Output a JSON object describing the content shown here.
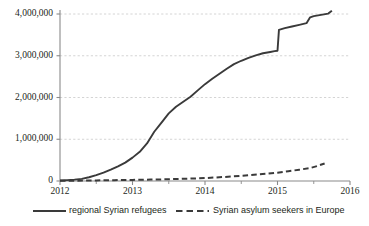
{
  "chart_data": {
    "type": "line",
    "title": "",
    "xlabel": "",
    "ylabel": "",
    "xlim": [
      2012,
      2016
    ],
    "ylim": [
      0,
      4000000
    ],
    "grid": true,
    "legend_position": "bottom",
    "x_tick_labels": [
      "2012",
      "2013",
      "2014",
      "2015",
      "2016"
    ],
    "x_tick_values": [
      2012,
      2013,
      2014,
      2015,
      2016
    ],
    "y_tick_labels": [
      "0",
      "1,000,000",
      "2,000,000",
      "3,000,000",
      "4,000,000"
    ],
    "y_tick_values": [
      0,
      1000000,
      2000000,
      3000000,
      4000000
    ],
    "x_minor_tick_values": [
      2012.5,
      2013.5,
      2014.5,
      2015.5
    ],
    "series": [
      {
        "name": "regional Syrian refugees",
        "style": "solid",
        "color": "#3a3a3a",
        "x": [
          2012.0,
          2012.1,
          2012.2,
          2012.3,
          2012.4,
          2012.5,
          2012.6,
          2012.7,
          2012.8,
          2012.9,
          2013.0,
          2013.1,
          2013.2,
          2013.3,
          2013.4,
          2013.5,
          2013.6,
          2013.7,
          2013.8,
          2013.9,
          2014.0,
          2014.1,
          2014.2,
          2014.3,
          2014.4,
          2014.5,
          2014.6,
          2014.7,
          2014.8,
          2014.9,
          2014.96,
          2015.0,
          2015.02,
          2015.1,
          2015.2,
          2015.3,
          2015.4,
          2015.45,
          2015.5,
          2015.6,
          2015.7,
          2015.75
        ],
        "y": [
          12000,
          20000,
          32000,
          52000,
          90000,
          140000,
          200000,
          270000,
          350000,
          440000,
          560000,
          700000,
          900000,
          1180000,
          1400000,
          1620000,
          1780000,
          1900000,
          2020000,
          2170000,
          2320000,
          2450000,
          2570000,
          2690000,
          2800000,
          2880000,
          2950000,
          3010000,
          3060000,
          3090000,
          3110000,
          3120000,
          3620000,
          3660000,
          3700000,
          3740000,
          3780000,
          3920000,
          3950000,
          3980000,
          4010000,
          4080000
        ]
      },
      {
        "name": "Syrian asylum seekers in Europe",
        "style": "dashed",
        "color": "#3a3a3a",
        "x": [
          2012.0,
          2012.25,
          2012.5,
          2012.75,
          2013.0,
          2013.25,
          2013.5,
          2013.75,
          2014.0,
          2014.25,
          2014.5,
          2014.75,
          2015.0,
          2015.15,
          2015.3,
          2015.45,
          2015.55,
          2015.65
        ],
        "y": [
          4000,
          8000,
          14000,
          20000,
          26000,
          34000,
          42000,
          55000,
          70000,
          95000,
          125000,
          160000,
          200000,
          235000,
          270000,
          310000,
          360000,
          420000
        ]
      }
    ]
  },
  "legend": {
    "items": [
      {
        "label": "regional Syrian refugees",
        "style": "solid"
      },
      {
        "label": "Syrian asylum seekers in Europe",
        "style": "dashed"
      }
    ]
  },
  "colors": {
    "line": "#3a3a3a",
    "gridline": "#c9c9c9",
    "axis": "#8a8a8a",
    "text": "#231f20",
    "background": "#ffffff"
  }
}
